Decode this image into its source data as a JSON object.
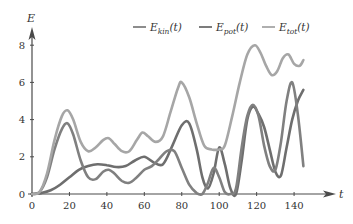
{
  "chart_data": {
    "type": "line",
    "title": "",
    "xlabel": "t",
    "ylabel": "E",
    "xlim": [
      0,
      150
    ],
    "ylim": [
      0,
      9
    ],
    "xticks": [
      0,
      20,
      40,
      60,
      80,
      100,
      120,
      140
    ],
    "yticks": [
      0,
      2,
      4,
      6,
      8
    ],
    "grid": false,
    "legend_position": "top",
    "series": [
      {
        "name": "E_kin(t)",
        "label_main": "E",
        "label_sub": "kin",
        "label_tail": "(t)",
        "color": "#808080",
        "x": [
          0,
          4,
          8,
          12,
          16,
          19,
          22,
          26,
          30,
          34,
          38,
          41,
          44,
          48,
          52,
          56,
          60,
          64,
          68,
          72,
          76,
          80,
          84,
          88,
          91,
          94,
          97,
          100,
          103,
          106,
          109,
          112,
          115,
          118,
          121,
          124,
          127,
          130,
          133,
          136,
          139,
          142,
          145
        ],
        "y": [
          0,
          0.1,
          0.9,
          2.4,
          3.5,
          3.8,
          3.2,
          1.8,
          0.9,
          0.8,
          1.2,
          1.3,
          1.1,
          0.7,
          0.6,
          0.9,
          1.3,
          1.5,
          1.9,
          2.3,
          2.3,
          1.4,
          0.5,
          0.05,
          0.0,
          0.6,
          1.4,
          0.9,
          0.1,
          0.0,
          0.3,
          2.5,
          4.2,
          4.8,
          4.2,
          2.6,
          1.5,
          1.3,
          2.8,
          5.0,
          6.0,
          4.3,
          1.5
        ]
      },
      {
        "name": "E_pot(t)",
        "label_main": "E",
        "label_sub": "pot",
        "label_tail": "(t)",
        "color": "#6e6e6e",
        "x": [
          0,
          5,
          10,
          15,
          20,
          25,
          30,
          35,
          40,
          45,
          50,
          55,
          60,
          65,
          70,
          75,
          80,
          84,
          88,
          91,
          94,
          97,
          100,
          103,
          106,
          109,
          112,
          115,
          118,
          121,
          124,
          127,
          130,
          133,
          136,
          139,
          142,
          145
        ],
        "y": [
          0,
          0.05,
          0.2,
          0.5,
          0.9,
          1.3,
          1.5,
          1.6,
          1.55,
          1.45,
          1.5,
          1.8,
          2.0,
          1.7,
          1.6,
          2.6,
          3.7,
          3.8,
          2.4,
          0.9,
          0.3,
          1.1,
          2.5,
          1.6,
          0.3,
          0.0,
          1.8,
          4.0,
          4.7,
          4.3,
          3.6,
          2.4,
          1.2,
          1.0,
          2.5,
          4.0,
          5.0,
          5.6
        ]
      },
      {
        "name": "E_tot(t)",
        "label_main": "E",
        "label_sub": "tot",
        "label_tail": "(t)",
        "color": "#a6a6a6",
        "x": [
          0,
          4,
          8,
          12,
          16,
          19,
          22,
          26,
          30,
          34,
          38,
          41,
          44,
          48,
          52,
          56,
          59,
          62,
          66,
          70,
          74,
          78,
          80,
          84,
          88,
          92,
          96,
          100,
          103,
          107,
          111,
          115,
          119,
          122,
          125,
          128,
          131,
          134,
          137,
          140,
          143,
          145
        ],
        "y": [
          0,
          0.1,
          1.1,
          2.9,
          4.2,
          4.5,
          4.0,
          2.8,
          2.3,
          2.5,
          2.9,
          3.0,
          2.7,
          2.3,
          2.3,
          2.9,
          3.3,
          3.1,
          2.8,
          3.1,
          4.4,
          5.7,
          6.0,
          5.2,
          3.8,
          2.6,
          2.4,
          2.4,
          2.6,
          4.2,
          6.0,
          7.5,
          8.0,
          7.6,
          6.9,
          6.4,
          6.6,
          7.3,
          7.5,
          7.0,
          6.9,
          7.2
        ]
      }
    ]
  },
  "plot": {
    "x_axis_label": "t",
    "y_axis_label": "E",
    "x_tick_labels": [
      "0",
      "20",
      "40",
      "60",
      "80",
      "100",
      "120",
      "140"
    ],
    "y_tick_labels": [
      "0",
      "2",
      "4",
      "6",
      "8"
    ]
  }
}
